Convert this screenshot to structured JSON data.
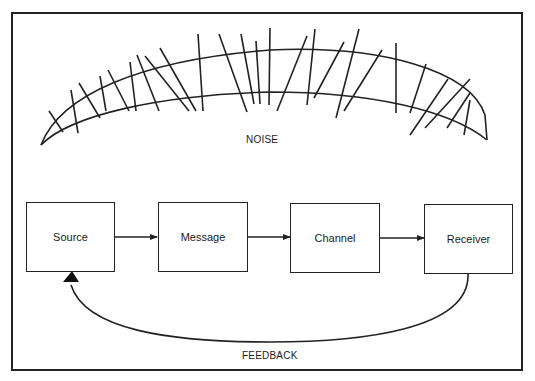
{
  "diagram": {
    "type": "communication-model",
    "noise_label": "NOISE",
    "feedback_label": "FEEDBACK",
    "nodes": [
      {
        "id": "source",
        "label": "Source"
      },
      {
        "id": "message",
        "label": "Message"
      },
      {
        "id": "channel",
        "label": "Channel"
      },
      {
        "id": "receiver",
        "label": "Receiver"
      }
    ],
    "edges": [
      {
        "from": "source",
        "to": "message"
      },
      {
        "from": "message",
        "to": "channel"
      },
      {
        "from": "channel",
        "to": "receiver"
      },
      {
        "from": "receiver",
        "to": "source",
        "label": "FEEDBACK"
      }
    ],
    "colors": {
      "stroke": "#222222",
      "background": "#ffffff"
    }
  }
}
